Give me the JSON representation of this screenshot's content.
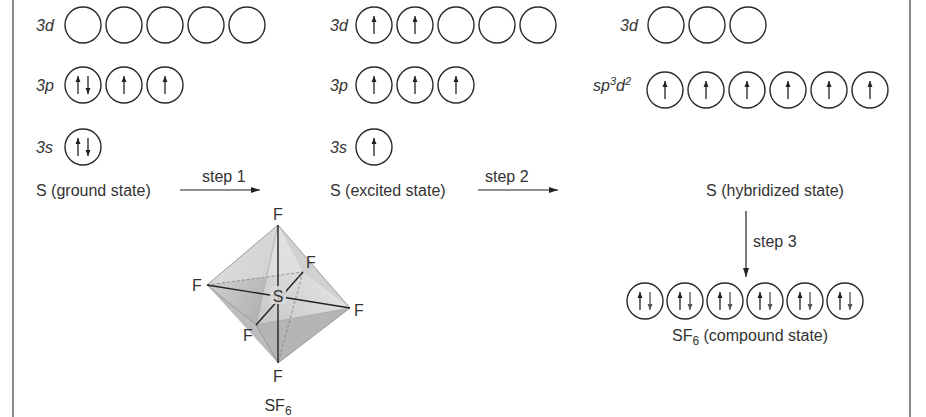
{
  "diagram": {
    "columns": [
      {
        "id": "ground",
        "rows": [
          {
            "label": "3d",
            "orbitals": [
              "",
              "",
              "",
              "",
              ""
            ]
          },
          {
            "label": "3p",
            "orbitals": [
              "updown",
              "up",
              "up"
            ]
          },
          {
            "label": "3s",
            "orbitals": [
              "updown"
            ]
          }
        ],
        "state_label": "S (ground state)"
      },
      {
        "id": "excited",
        "rows": [
          {
            "label": "3d",
            "orbitals": [
              "up",
              "up",
              "",
              "",
              ""
            ]
          },
          {
            "label": "3p",
            "orbitals": [
              "up",
              "up",
              "up"
            ]
          },
          {
            "label": "3s",
            "orbitals": [
              "up"
            ]
          }
        ],
        "state_label": "S (excited state)"
      },
      {
        "id": "hybridized",
        "rows": [
          {
            "label": "3d",
            "orbitals": [
              "",
              "",
              ""
            ]
          },
          {
            "label": "sp3d2",
            "label_base": "sp",
            "label_sup1": "3",
            "label_mid": "d",
            "label_sup2": "2",
            "orbitals": [
              "up",
              "up",
              "up",
              "up",
              "up",
              "up"
            ]
          }
        ],
        "state_label": "S (hybridized state)"
      }
    ],
    "steps": {
      "step1": "step 1",
      "step2": "step 2",
      "step3": "step 3"
    },
    "compound": {
      "orbitals": [
        "updown",
        "updown",
        "updown",
        "updown",
        "updown",
        "updown"
      ],
      "label_prefix": "SF",
      "label_sub": "6",
      "label_suffix": " (compound state)"
    },
    "molecule": {
      "center_atom": "S",
      "ligand_atom": "F",
      "ligand_count": 6,
      "caption_prefix": "SF",
      "caption_sub": "6"
    }
  }
}
